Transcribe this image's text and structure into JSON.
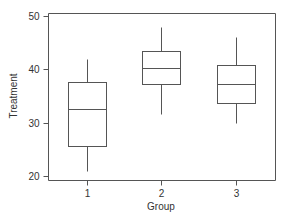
{
  "chart_data": {
    "type": "box",
    "title": "",
    "xlabel": "Group",
    "ylabel": "Treatment",
    "categories": [
      "1",
      "2",
      "3"
    ],
    "ylim": [
      20,
      50
    ],
    "yticks": [
      20,
      30,
      40,
      50
    ],
    "grid": false,
    "legend": null,
    "boxes": [
      {
        "group": "1",
        "whisker_low": 21,
        "q1": 25.7,
        "median": 32.5,
        "q3": 37.6,
        "whisker_high": 42
      },
      {
        "group": "2",
        "whisker_low": 31.7,
        "q1": 37.2,
        "median": 40.2,
        "q3": 43.4,
        "whisker_high": 48
      },
      {
        "group": "3",
        "whisker_low": 30,
        "q1": 33.6,
        "median": 37.2,
        "q3": 40.9,
        "whisker_high": 46
      }
    ]
  },
  "colors": {
    "line": "#555555",
    "text": "#333333",
    "background": "#ffffff"
  }
}
